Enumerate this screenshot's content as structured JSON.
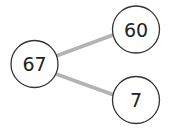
{
  "diagram": {
    "type": "number-bond",
    "whole": {
      "value": "67"
    },
    "parts": [
      {
        "value": "60"
      },
      {
        "value": "7"
      }
    ],
    "colors": {
      "edge": "#b3b3b3",
      "circle_stroke": "#333333",
      "text": "#222222"
    }
  }
}
